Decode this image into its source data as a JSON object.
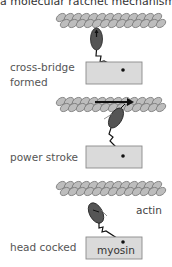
{
  "caption": "a molecular ratchet mechanism:",
  "colors": {
    "actin_fill": "#b8b8b8",
    "actin_stroke": "#7a7a7a",
    "myosin_head": "#555555",
    "myosin_box_fill": "#d9d9d9",
    "myosin_box_stroke": "#8a8a8a",
    "arrow": "#1a1a1a",
    "label_text": "#555555"
  },
  "panels": [
    {
      "label_line1": "cross-bridge",
      "label_line2": "formed",
      "state": "head bound, upright"
    },
    {
      "label_line1": "power stroke",
      "state": "head tilted, filament pushed",
      "arrow": "rightward"
    },
    {
      "label_line1": "head cocked",
      "state": "head detached, cocked"
    }
  ],
  "labels": {
    "actin": "actin",
    "myosin": "myosin"
  }
}
